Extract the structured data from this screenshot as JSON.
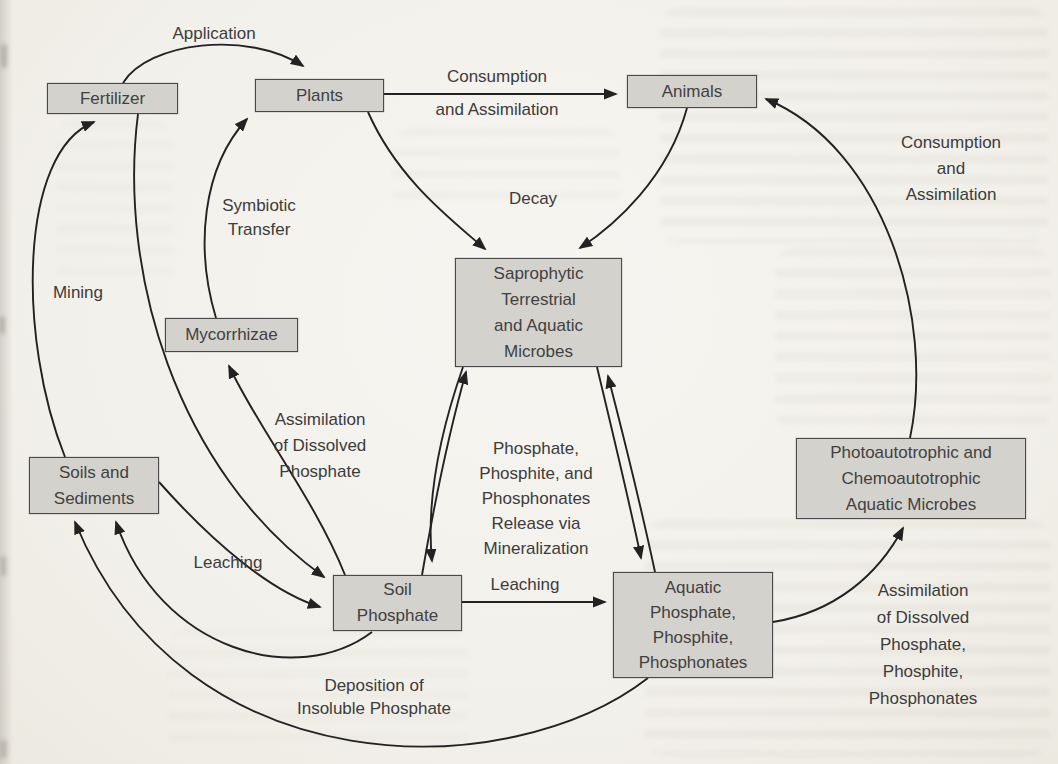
{
  "figure": {
    "type": "phosphorus-cycle-flow-diagram",
    "colors": {
      "paper": "#f3f1ec",
      "box_fill": "#d4d2cd",
      "box_border": "#4a4a4a",
      "arrow": "#222222",
      "text": "#3d3d3d"
    }
  },
  "nodes": {
    "fertilizer": {
      "label": "Fertilizer"
    },
    "plants": {
      "label": "Plants"
    },
    "animals": {
      "label": "Animals"
    },
    "mycorrhizae": {
      "label": "Mycorrhizae"
    },
    "saprophytic_microbes": {
      "label": "Saprophytic\nTerrestrial\nand Aquatic\nMicrobes"
    },
    "soils_sediments": {
      "label": "Soils and\nSediments"
    },
    "soil_phosphate": {
      "label": "Soil\nPhosphate"
    },
    "aquatic_phosphate": {
      "label": "Aquatic\nPhosphate,\nPhosphite,\nPhosphonates"
    },
    "photo_chemo_microbes": {
      "label": "Photoautotrophic and\nChemoautotrophic\nAquatic Microbes"
    }
  },
  "edge_labels": {
    "application": "Application",
    "consumption_plants_animals": "Consumption\nand Assimilation",
    "consumption_microbes_animals": "Consumption\nand Assimilation",
    "symbiotic_transfer": "Symbiotic\nTransfer",
    "decay": "Decay",
    "mining": "Mining",
    "assimilation_dissolved_soil": "Assimilation\nof Dissolved\nPhosphate",
    "leaching_soils_to_soil": "Leaching",
    "leaching_soil_to_aquatic": "Leaching",
    "mineralization_release": "Phosphate,\nPhosphite, and\nPhosphonates\nRelease via\nMineralization",
    "assimilation_dissolved_aquatic": "Assimilation\nof Dissolved\nPhosphate,\nPhosphite,\nPhosphonates",
    "deposition_insoluble": "Deposition of\nInsoluble Phosphate"
  },
  "edges": [
    {
      "from": "fertilizer",
      "to": "plants",
      "label": "Application"
    },
    {
      "from": "plants",
      "to": "animals",
      "label": "Consumption and Assimilation"
    },
    {
      "from": "plants",
      "to": "saprophytic_microbes",
      "label": "Decay"
    },
    {
      "from": "animals",
      "to": "saprophytic_microbes",
      "label": "Decay"
    },
    {
      "from": "mycorrhizae",
      "to": "plants",
      "label": "Symbiotic Transfer"
    },
    {
      "from": "soil_phosphate",
      "to": "mycorrhizae",
      "label": "Assimilation of Dissolved Phosphate"
    },
    {
      "from": "soils_sediments",
      "to": "fertilizer",
      "label": "Mining"
    },
    {
      "from": "fertilizer",
      "to": "soil_phosphate",
      "label": ""
    },
    {
      "from": "soils_sediments",
      "to": "soil_phosphate",
      "label": "Leaching"
    },
    {
      "from": "soil_phosphate",
      "to": "soils_sediments",
      "label": "Deposition of Insoluble Phosphate"
    },
    {
      "from": "aquatic_phosphate",
      "to": "soils_sediments",
      "label": "Deposition of Insoluble Phosphate"
    },
    {
      "from": "saprophytic_microbes",
      "to": "soil_phosphate",
      "label": "Phosphate, Phosphite, and Phosphonates Release via Mineralization"
    },
    {
      "from": "soil_phosphate",
      "to": "saprophytic_microbes",
      "label": ""
    },
    {
      "from": "saprophytic_microbes",
      "to": "aquatic_phosphate",
      "label": "Phosphate, Phosphite, and Phosphonates Release via Mineralization"
    },
    {
      "from": "aquatic_phosphate",
      "to": "saprophytic_microbes",
      "label": ""
    },
    {
      "from": "soil_phosphate",
      "to": "aquatic_phosphate",
      "label": "Leaching"
    },
    {
      "from": "aquatic_phosphate",
      "to": "photo_chemo_microbes",
      "label": "Assimilation of Dissolved Phosphate, Phosphite, Phosphonates"
    },
    {
      "from": "photo_chemo_microbes",
      "to": "animals",
      "label": "Consumption and Assimilation"
    }
  ]
}
